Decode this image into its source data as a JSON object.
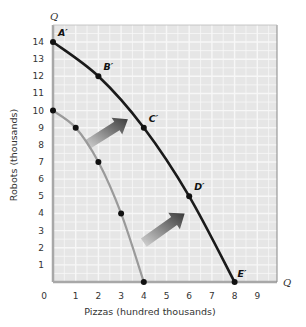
{
  "chart_data": {
    "type": "line",
    "title": "",
    "xlabel": "Pizzas (hundred thousands)",
    "ylabel": "Robots (thousands)",
    "x_axis_end_label": "Q",
    "y_axis_end_label": "Q",
    "xlim": [
      0,
      9
    ],
    "ylim": [
      0,
      14
    ],
    "x_ticks": [
      "0",
      "1",
      "2",
      "3",
      "4",
      "5",
      "6",
      "7",
      "8",
      "9"
    ],
    "y_ticks": [
      "1",
      "2",
      "3",
      "4",
      "5",
      "6",
      "7",
      "8",
      "9",
      "10",
      "11",
      "12",
      "13",
      "14"
    ],
    "grid": true,
    "series": [
      {
        "name": "Original PPF",
        "color": "#9a9a9a",
        "points": [
          {
            "x": 0,
            "y": 10
          },
          {
            "x": 1,
            "y": 9
          },
          {
            "x": 2,
            "y": 7
          },
          {
            "x": 3,
            "y": 4
          },
          {
            "x": 4,
            "y": 0
          }
        ]
      },
      {
        "name": "Shifted PPF",
        "color": "#1a1a1a",
        "points": [
          {
            "x": 0,
            "y": 14,
            "label": "A′"
          },
          {
            "x": 2,
            "y": 12,
            "label": "B′"
          },
          {
            "x": 4,
            "y": 9,
            "label": "C′"
          },
          {
            "x": 6,
            "y": 5,
            "label": "D′"
          },
          {
            "x": 8,
            "y": 0,
            "label": "E′"
          }
        ]
      }
    ],
    "annotations": [
      {
        "type": "arrow",
        "meaning": "outward shift",
        "from": {
          "x": 1.5,
          "y": 8
        },
        "to": {
          "x": 3.3,
          "y": 9.5
        }
      },
      {
        "type": "arrow",
        "meaning": "outward shift",
        "from": {
          "x": 4.0,
          "y": 2.3
        },
        "to": {
          "x": 5.8,
          "y": 4.0
        }
      }
    ],
    "colors": {
      "plot_background": "#e6e6e6",
      "grid": "#f7f7f7",
      "axis": "#a8a8a8"
    }
  }
}
